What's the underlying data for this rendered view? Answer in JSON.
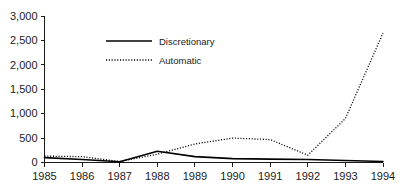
{
  "chart_data": {
    "type": "line",
    "title": "",
    "xlabel": "",
    "ylabel": "",
    "x": [
      1985,
      1986,
      1987,
      1988,
      1989,
      1990,
      1991,
      1992,
      1993,
      1994
    ],
    "categories": [
      "1985",
      "1986",
      "1987",
      "1988",
      "1989",
      "1990",
      "1991",
      "1992",
      "1993",
      "1994"
    ],
    "series": [
      {
        "name": "Discretionary",
        "style": "solid",
        "values": [
          100,
          60,
          15,
          230,
          120,
          80,
          70,
          60,
          40,
          20
        ]
      },
      {
        "name": "Automatic",
        "style": "dotted",
        "values": [
          130,
          120,
          20,
          170,
          380,
          500,
          470,
          150,
          900,
          2650
        ]
      }
    ],
    "xlim": [
      1985,
      1994
    ],
    "ylim": [
      0,
      3000
    ],
    "yticks": [
      0,
      500,
      1000,
      1500,
      2000,
      2500,
      3000
    ],
    "ytick_labels": [
      "0",
      "500",
      "1,000",
      "1,500",
      "2,000",
      "2,500",
      "3,000"
    ],
    "xtick_labels": [
      "1985",
      "1986",
      "1987",
      "1988",
      "1989",
      "1990",
      "1991",
      "1992",
      "1993",
      "1994"
    ],
    "grid": false,
    "legend_position": "inside-top-left",
    "legend_entries": [
      {
        "label": "Discretionary",
        "style": "solid"
      },
      {
        "label": "Automatic",
        "style": "dotted"
      }
    ],
    "colors": {
      "axis": "#1a1a1a",
      "discretionary": "#000000",
      "automatic": "#000000",
      "background": "#ffffff"
    }
  }
}
